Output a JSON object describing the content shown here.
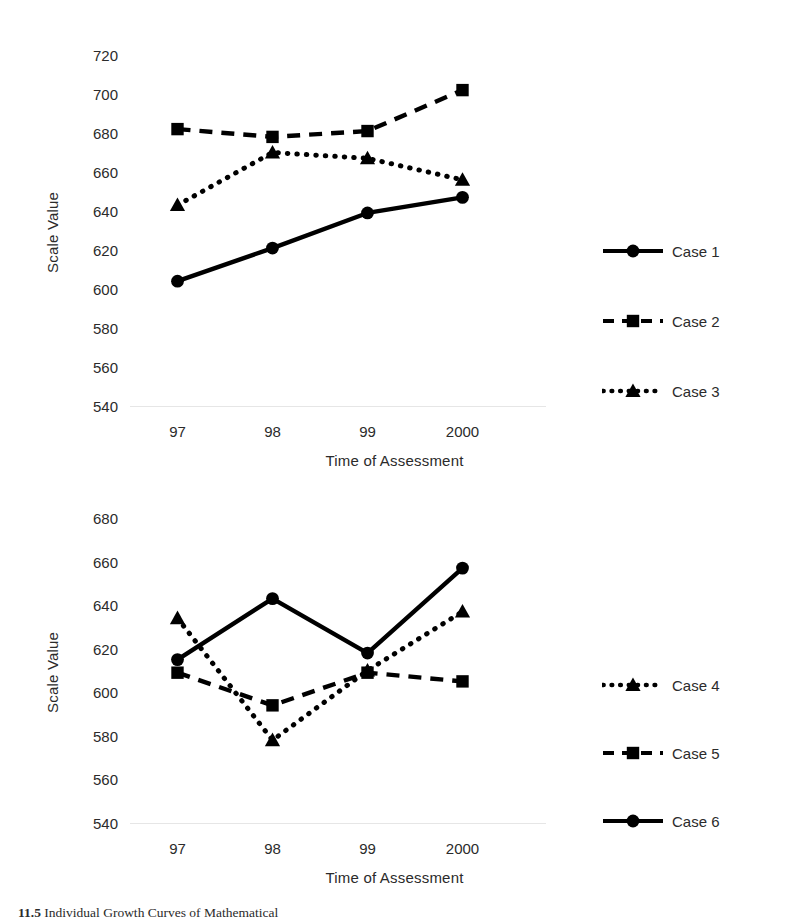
{
  "figure": {
    "caption_number": "11.5",
    "caption_text": "Individual Growth Curves of Mathematical"
  },
  "chart_data": [
    {
      "id": "top",
      "type": "line",
      "title": "",
      "xlabel": "Time of Assessment",
      "ylabel": "Scale Value",
      "categories": [
        "97",
        "98",
        "99",
        "2000"
      ],
      "yticks": [
        720,
        700,
        680,
        660,
        640,
        620,
        600,
        580,
        560,
        540
      ],
      "ylim": [
        540,
        720
      ],
      "grid": false,
      "legend_position": "right",
      "series": [
        {
          "name": "Case 1",
          "values": [
            604,
            621,
            639,
            647
          ],
          "line_style": "solid",
          "marker": "circle",
          "color": "#000000"
        },
        {
          "name": "Case 2",
          "values": [
            682,
            678,
            681,
            702
          ],
          "line_style": "dashed",
          "marker": "square",
          "color": "#000000"
        },
        {
          "name": "Case 3",
          "values": [
            643,
            670,
            667,
            656
          ],
          "line_style": "dotted",
          "marker": "triangle",
          "color": "#000000"
        }
      ]
    },
    {
      "id": "bottom",
      "type": "line",
      "title": "",
      "xlabel": "Time of Assessment",
      "ylabel": "Scale Value",
      "categories": [
        "97",
        "98",
        "99",
        "2000"
      ],
      "yticks": [
        680,
        660,
        640,
        620,
        600,
        580,
        560,
        540
      ],
      "ylim": [
        540,
        680
      ],
      "grid": false,
      "legend_position": "right",
      "series": [
        {
          "name": "Case 4",
          "values": [
            634,
            578,
            610,
            637
          ],
          "line_style": "dotted",
          "marker": "triangle",
          "color": "#000000"
        },
        {
          "name": "Case 5",
          "values": [
            609,
            594,
            609,
            605
          ],
          "line_style": "dashed",
          "marker": "square",
          "color": "#000000"
        },
        {
          "name": "Case 6",
          "values": [
            615,
            643,
            618,
            657
          ],
          "line_style": "solid",
          "marker": "circle",
          "color": "#000000"
        }
      ]
    }
  ]
}
